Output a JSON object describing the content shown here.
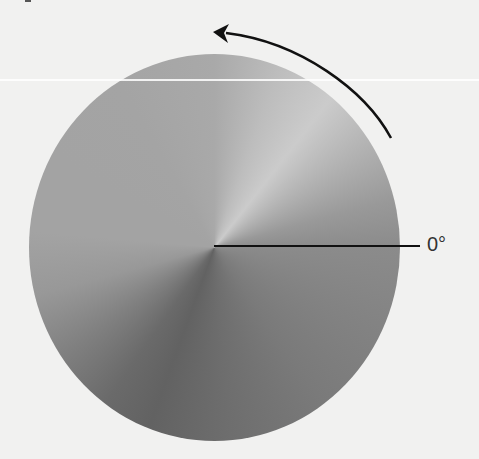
{
  "diagram": {
    "reference_angle_label": "0°",
    "rotation_direction": "counterclockwise",
    "colors": {
      "background": "#f1f1f0",
      "line": "#111111",
      "label": "#333333",
      "gradient_light": "#cbcbcb",
      "gradient_dark": "#626262"
    }
  }
}
